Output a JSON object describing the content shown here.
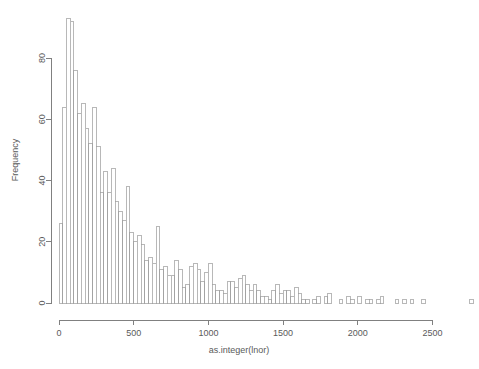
{
  "chart_data": {
    "type": "bar",
    "subtype": "histogram",
    "title": "",
    "xlabel": "as.integer(lnor)",
    "ylabel": "Frequency",
    "xlim": [
      0,
      2800
    ],
    "ylim": [
      0,
      93
    ],
    "xticks": [
      0,
      500,
      1000,
      1500,
      2000,
      2500
    ],
    "xtick_labels": [
      "0",
      "500",
      "1000",
      "1500",
      "2000",
      "2500"
    ],
    "yticks": [
      0,
      20,
      40,
      60,
      80
    ],
    "ytick_labels": [
      "0",
      "20",
      "40",
      "60",
      "80"
    ],
    "grid": false,
    "legend": false,
    "bin_width": 25,
    "bin_starts": [
      0,
      25,
      50,
      75,
      100,
      125,
      150,
      175,
      200,
      225,
      250,
      275,
      300,
      325,
      350,
      375,
      400,
      425,
      450,
      475,
      500,
      525,
      550,
      575,
      600,
      625,
      650,
      675,
      700,
      725,
      750,
      775,
      800,
      825,
      850,
      875,
      900,
      925,
      950,
      975,
      1000,
      1025,
      1050,
      1075,
      1100,
      1125,
      1150,
      1175,
      1200,
      1225,
      1250,
      1275,
      1300,
      1325,
      1350,
      1375,
      1400,
      1425,
      1450,
      1475,
      1500,
      1525,
      1550,
      1575,
      1600,
      1625,
      1650,
      1675,
      1700,
      1725,
      1750,
      1775,
      1800,
      1825,
      1850,
      1875,
      1900,
      1925,
      1950,
      1975,
      2000,
      2025,
      2050,
      2075,
      2100,
      2125,
      2150,
      2175,
      2200,
      2225,
      2250,
      2275,
      2300,
      2325,
      2350,
      2375,
      2400,
      2425,
      2450,
      2475,
      2500,
      2525,
      2550,
      2575,
      2600,
      2625,
      2650,
      2675,
      2700,
      2725,
      2750
    ],
    "values": [
      26,
      64,
      93,
      92,
      76,
      62,
      65,
      57,
      52,
      64,
      51,
      36,
      43,
      36,
      44,
      33,
      30,
      27,
      38,
      23,
      20,
      22,
      19,
      14,
      15,
      13,
      25,
      11,
      12,
      9,
      9,
      14,
      11,
      5,
      6,
      12,
      13,
      11,
      7,
      10,
      13,
      6,
      4,
      4,
      3,
      7,
      7,
      5,
      8,
      9,
      6,
      4,
      6,
      4,
      2,
      2,
      1,
      4,
      6,
      3,
      4,
      4,
      2,
      5,
      3,
      1,
      1,
      0,
      1,
      2,
      0,
      2,
      3,
      0,
      0,
      1,
      0,
      2,
      1,
      0,
      2,
      0,
      1,
      1,
      0,
      1,
      2,
      0,
      0,
      0,
      1,
      0,
      1,
      0,
      1,
      0,
      0,
      1,
      0,
      0,
      0,
      0,
      0,
      0,
      0,
      0,
      0,
      0,
      0,
      0,
      1
    ],
    "categories": [
      "0",
      "25",
      "50",
      "75",
      "100",
      "125",
      "150",
      "175",
      "200",
      "225",
      "250",
      "275",
      "300",
      "325",
      "350",
      "375",
      "400",
      "425",
      "450",
      "475",
      "500",
      "525",
      "550",
      "575",
      "600",
      "625",
      "650",
      "675",
      "700",
      "725",
      "750",
      "775",
      "800",
      "825",
      "850",
      "875",
      "900",
      "925",
      "950",
      "975",
      "1000",
      "1025",
      "1050",
      "1075",
      "1100",
      "1125",
      "1150",
      "1175",
      "1200",
      "1225",
      "1250",
      "1275",
      "1300",
      "1325",
      "1350",
      "1375",
      "1400",
      "1425",
      "1450",
      "1475",
      "1500",
      "1525",
      "1550",
      "1575",
      "1600",
      "1625",
      "1650",
      "1675",
      "1700",
      "1725",
      "1750",
      "1775",
      "1800",
      "1825",
      "1850",
      "1875",
      "1900",
      "1925",
      "1950",
      "1975",
      "2000",
      "2025",
      "2050",
      "2075",
      "2100",
      "2125",
      "2150",
      "2175",
      "2200",
      "2225",
      "2250",
      "2275",
      "2300",
      "2325",
      "2350",
      "2375",
      "2400",
      "2425",
      "2450",
      "2475",
      "2500",
      "2525",
      "2550",
      "2575",
      "2600",
      "2625",
      "2650",
      "2675",
      "2700",
      "2725",
      "2750"
    ],
    "colors": {
      "bar_fill": "#ffffff",
      "bar_stroke": "#9a9a9a",
      "axis": "#808080",
      "text": "#5a5a5a",
      "background": "#ffffff"
    }
  }
}
